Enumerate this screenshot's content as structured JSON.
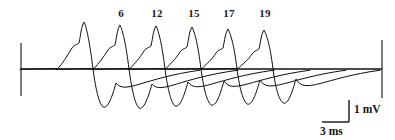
{
  "figure": {
    "kind": "electrophysiology-recording",
    "background_color": "#ffffff",
    "trace_color": "#101010",
    "trace_width": 1.0,
    "width": 395,
    "height": 140,
    "baseline_y": 69
  },
  "axes": {
    "left_marker": {
      "x": 21,
      "y_top": 43,
      "y_bottom": 96
    },
    "right_marker": {
      "x": 382,
      "y_top": 40,
      "y_bottom": 98
    },
    "baseline": {
      "x_start": 21,
      "x_end": 382,
      "y": 69
    }
  },
  "sweep_labels": [
    {
      "text": "6",
      "x": 121,
      "y": 8
    },
    {
      "text": "12",
      "x": 157,
      "y": 8
    },
    {
      "text": "15",
      "x": 194,
      "y": 8
    },
    {
      "text": "17",
      "x": 229,
      "y": 8
    },
    {
      "text": "19",
      "x": 265,
      "y": 8
    }
  ],
  "scale_bar": {
    "voltage_label": "1 mV",
    "time_label": "3 ms",
    "vertical_x": 349,
    "vertical_y_top": 100,
    "vertical_y_bottom": 122,
    "horizontal_y": 122,
    "horizontal_x_start": 322,
    "horizontal_x_end": 349
  },
  "chart_data": {
    "type": "line",
    "title": "",
    "xlabel": "",
    "ylabel": "",
    "grid": false,
    "legend": "none",
    "units": {
      "x": "ms",
      "y": "mV"
    },
    "scale": {
      "x_per_px": 0.0833,
      "y_per_px": 0.0455
    },
    "sweeps": [
      {
        "name": "sweep-1",
        "label": "",
        "peak_x": 84,
        "peak_y": 22,
        "trough_x": 103,
        "trough_y": 107,
        "onset_x": 58,
        "shoulder_x": 72,
        "shoulder_y": 48,
        "recovery_end_x": 200
      },
      {
        "name": "sweep-2",
        "label": "6",
        "peak_x": 120,
        "peak_y": 25,
        "trough_x": 139,
        "trough_y": 108,
        "onset_x": 94,
        "shoulder_x": 108,
        "shoulder_y": 50,
        "recovery_end_x": 238
      },
      {
        "name": "sweep-3",
        "label": "12",
        "peak_x": 156,
        "peak_y": 26,
        "trough_x": 175,
        "trough_y": 106,
        "onset_x": 130,
        "shoulder_x": 144,
        "shoulder_y": 51,
        "recovery_end_x": 274
      },
      {
        "name": "sweep-4",
        "label": "15",
        "peak_x": 192,
        "peak_y": 27,
        "trough_x": 211,
        "trough_y": 105,
        "onset_x": 166,
        "shoulder_x": 180,
        "shoulder_y": 52,
        "recovery_end_x": 310
      },
      {
        "name": "sweep-5",
        "label": "17",
        "peak_x": 228,
        "peak_y": 29,
        "trough_x": 247,
        "trough_y": 104,
        "onset_x": 202,
        "shoulder_x": 216,
        "shoulder_y": 53,
        "recovery_end_x": 346
      },
      {
        "name": "sweep-6",
        "label": "19",
        "peak_x": 264,
        "peak_y": 30,
        "trough_x": 283,
        "trough_y": 103,
        "onset_x": 238,
        "shoulder_x": 252,
        "shoulder_y": 54,
        "recovery_end_x": 380
      }
    ]
  }
}
